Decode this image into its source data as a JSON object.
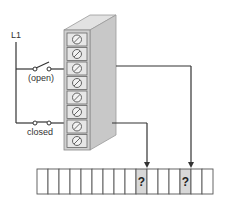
{
  "labels": {
    "line": "L1",
    "open_switch": "(open)",
    "closed_switch": "closed",
    "unknown": "?"
  },
  "terminal_block": {
    "terminal_count": 8,
    "wired_terminals": [
      3,
      7
    ]
  },
  "register": {
    "cell_count": 16,
    "highlighted_cells": [
      9,
      13
    ],
    "highlight_color": "#d8d8d8"
  },
  "colors": {
    "wire": "#333333",
    "block_front": "#d0d0d0",
    "block_side": "#c4c4c4",
    "block_top": "#e2e2e2"
  }
}
